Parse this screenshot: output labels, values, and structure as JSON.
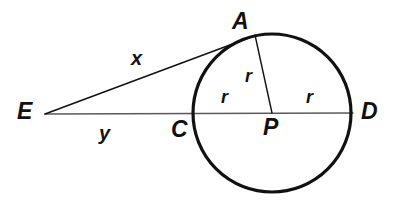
{
  "figure": {
    "type": "geometry-diagram",
    "background_color": "#ffffff",
    "stroke_color": "#111111",
    "line_color": "#4a4a4a"
  },
  "points": [
    {
      "id": "E",
      "label": "E",
      "x": 45,
      "y": 114,
      "role": "external-point"
    },
    {
      "id": "A",
      "label": "A",
      "x": 253,
      "y": 37,
      "role": "tangent-point"
    },
    {
      "id": "C",
      "label": "C",
      "x": 194,
      "y": 113,
      "role": "near-intersection"
    },
    {
      "id": "P",
      "label": "P",
      "x": 272,
      "y": 113,
      "role": "circle-center"
    },
    {
      "id": "D",
      "label": "D",
      "x": 351,
      "y": 113,
      "role": "far-intersection"
    }
  ],
  "circle": {
    "center_label": "P",
    "cx": 272,
    "cy": 113,
    "r": 79,
    "stroke_width": 3.2
  },
  "segments": [
    {
      "id": "EA",
      "label": "x",
      "from": "E",
      "to": "A",
      "kind": "tangent"
    },
    {
      "id": "EC",
      "label": "y",
      "from": "E",
      "to": "C",
      "kind": "external-secant"
    },
    {
      "id": "ED",
      "label": "",
      "from": "E",
      "to": "D",
      "kind": "secant-through-center"
    },
    {
      "id": "PA",
      "label": "r",
      "from": "P",
      "to": "A",
      "kind": "radius"
    },
    {
      "id": "PC",
      "label": "r",
      "from": "P",
      "to": "C",
      "kind": "radius"
    },
    {
      "id": "PD",
      "label": "r",
      "from": "P",
      "to": "D",
      "kind": "radius"
    }
  ],
  "labels": {
    "point_E": "E",
    "point_A": "A",
    "point_C": "C",
    "point_P": "P",
    "point_D": "D",
    "segment_x": "x",
    "segment_y": "y",
    "radius_upper": "r",
    "radius_left": "r",
    "radius_right": "r"
  },
  "label_positions": {
    "point_E": {
      "left": 17,
      "top": 100
    },
    "point_A": {
      "left": 232,
      "top": 10
    },
    "point_C": {
      "left": 171,
      "top": 118
    },
    "point_P": {
      "left": 263,
      "top": 116
    },
    "point_D": {
      "left": 361,
      "top": 100
    },
    "segment_x": {
      "left": 131,
      "top": 48
    },
    "segment_y": {
      "left": 99,
      "top": 123
    },
    "radius_upper": {
      "left": 245,
      "top": 67
    },
    "radius_left": {
      "left": 221,
      "top": 88
    },
    "radius_right": {
      "left": 306,
      "top": 88
    }
  }
}
